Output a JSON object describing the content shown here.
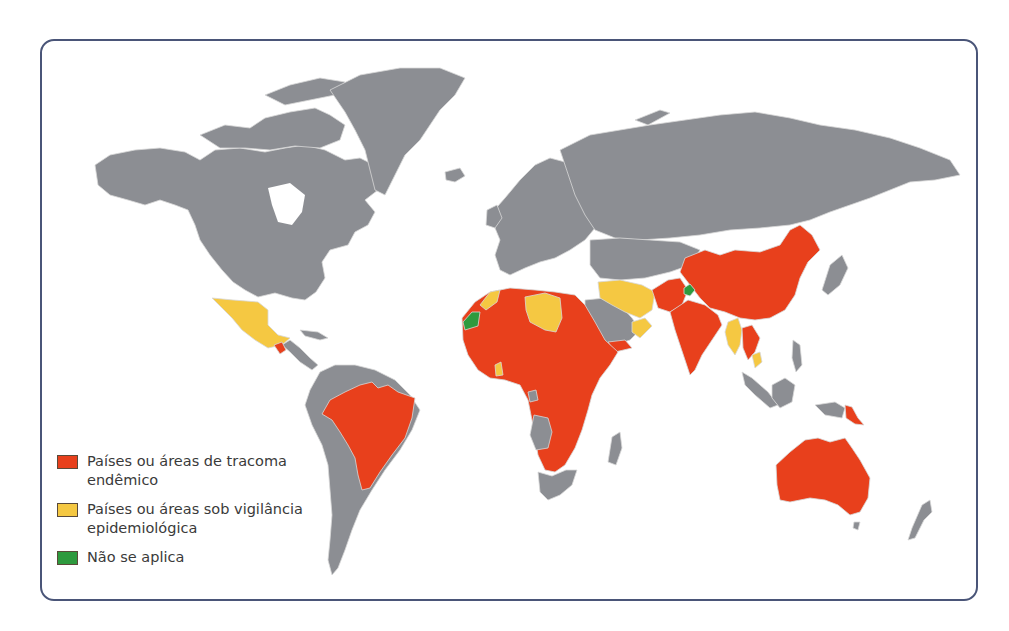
{
  "map": {
    "subject": "Trachoma endemicity world map",
    "colors": {
      "background": "#ffffff",
      "frame_border": "#4a5578",
      "land_default": "#8c8e93",
      "border_lines": "#d8d8d8",
      "endemic": "#e8401c",
      "surveillance": "#f5c842",
      "not_applicable": "#2e9a3e"
    },
    "regions": {
      "endemic": [
        "Brazil",
        "Guatemala",
        "Mauritania",
        "Mali",
        "Algeria",
        "Niger",
        "Chad",
        "Sudan",
        "Egypt",
        "Ethiopia",
        "Eritrea",
        "Somalia",
        "Kenya",
        "Tanzania",
        "Uganda",
        "DR Congo",
        "Nigeria",
        "Cameroon",
        "Central African Republic",
        "Zambia",
        "Zimbabwe",
        "Mozambique",
        "Malawi",
        "Namibia",
        "Botswana",
        "Yemen",
        "Pakistan",
        "India",
        "Nepal",
        "China",
        "Laos",
        "Cambodia",
        "Vietnam",
        "Papua New Guinea",
        "Australia"
      ],
      "surveillance": [
        "Mexico",
        "Morocco",
        "Libya",
        "Ghana",
        "Iraq",
        "Iran",
        "Oman",
        "Myanmar",
        "Thailand",
        "Solomon Islands"
      ],
      "not_applicable": [
        "Western Sahara",
        "Kashmir region"
      ]
    }
  },
  "legend": {
    "items": [
      {
        "label": "Países ou áreas de tracoma endêmico",
        "color": "#e8401c"
      },
      {
        "label": "Países ou áreas  sob vigilância epidemiológica",
        "color": "#f5c842"
      },
      {
        "label": "Não se aplica",
        "color": "#2e9a3e"
      }
    ]
  }
}
